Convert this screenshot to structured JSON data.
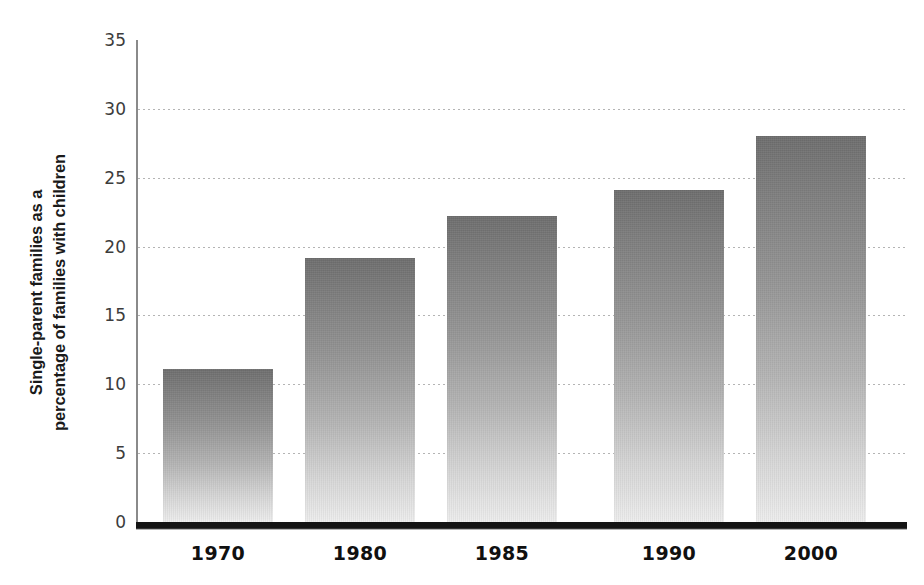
{
  "chart_data": {
    "type": "bar",
    "title": "",
    "subtitle": "",
    "xlabel": "",
    "ylabel_lines": [
      "Single-parent families as a",
      "percentage of families with children"
    ],
    "ylabel": "Single-parent families as a percentage of families with children",
    "categories": [
      "1970",
      "1980",
      "1985",
      "1990",
      "2000"
    ],
    "values": [
      11.1,
      19.2,
      22.2,
      24.1,
      28.0
    ],
    "ylim": [
      0,
      35
    ],
    "ytick_labels": [
      "0",
      "5",
      "10",
      "15",
      "20",
      "25",
      "30",
      "35"
    ],
    "ytick_values": [
      0,
      5,
      10,
      15,
      20,
      25,
      30,
      35
    ],
    "grid": true,
    "grid_style": "dotted-horizontal",
    "legend": false,
    "legend_position": "none",
    "annotations": [],
    "colors": {
      "bar_top": "#6e6e6e",
      "bar_bottom": "#ededed",
      "gridline": "#b4b4b4",
      "axis_spine": "#8a8a8a",
      "baseline": "#141414",
      "tick_text": "#3c3c3c",
      "category_text": "#101010",
      "axis_title_text": "#1a1a1a",
      "background": "#ffffff"
    }
  },
  "layout": {
    "plot_left": 136,
    "plot_top": 40,
    "plot_width": 769,
    "plot_height": 482,
    "bar_width": 110,
    "bar_slots": [
      163,
      305,
      447,
      614,
      756
    ]
  }
}
